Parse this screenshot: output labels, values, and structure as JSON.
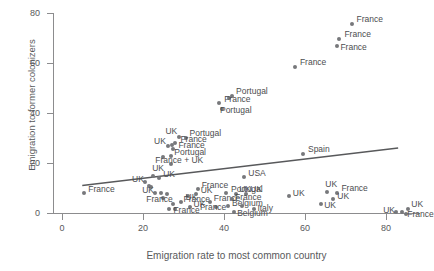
{
  "chart_data": {
    "type": "scatter",
    "title": "",
    "xlabel": "Emigration rate to most common country",
    "ylabel": "Emigration to former colonizers",
    "xlim": [
      0,
      90
    ],
    "ylim": [
      0,
      80
    ],
    "xticks": [
      0,
      20,
      40,
      60,
      80
    ],
    "yticks": [
      0,
      20,
      40,
      60,
      80
    ],
    "grid": false,
    "legend": "none",
    "point_color": "#77787b",
    "trendline": {
      "visible": true,
      "color": "#58595b",
      "x_start": 5,
      "y_start": 11,
      "x_end": 83,
      "y_end": 26
    },
    "labels": [
      "France",
      "UK",
      "Portugal",
      "Spain",
      "USA",
      "Belgium",
      "Italy",
      "France + UK"
    ],
    "points": [
      {
        "x": 71.5,
        "y": 75.5,
        "label": "France",
        "lx": 5,
        "ly": -5
      },
      {
        "x": 68.5,
        "y": 69.5,
        "label": "France",
        "lx": 5,
        "ly": -5
      },
      {
        "x": 68.0,
        "y": 67.0,
        "label": "France",
        "lx": 3,
        "ly": 1
      },
      {
        "x": 57.5,
        "y": 58.5,
        "label": "France",
        "lx": 5,
        "ly": -5
      },
      {
        "x": 42.0,
        "y": 47.0,
        "label": "Portugal",
        "lx": 4,
        "ly": -5
      },
      {
        "x": 41.2,
        "y": 46.0,
        "label": "",
        "lx": 0,
        "ly": 0
      },
      {
        "x": 38.8,
        "y": 44.0,
        "label": "France",
        "lx": 5,
        "ly": -4
      },
      {
        "x": 39.5,
        "y": 41.5,
        "label": "Portugal",
        "lx": -2,
        "ly": 1
      },
      {
        "x": 30.5,
        "y": 30.0,
        "label": "Portugal",
        "lx": 4,
        "ly": -5
      },
      {
        "x": 29.0,
        "y": 30.5,
        "label": "UK",
        "lx": -14,
        "ly": -6
      },
      {
        "x": 28.0,
        "y": 28.0,
        "label": "France",
        "lx": 5,
        "ly": -4
      },
      {
        "x": 27.2,
        "y": 27.2,
        "label": "",
        "lx": 0,
        "ly": 0
      },
      {
        "x": 26.2,
        "y": 26.8,
        "label": "UK",
        "lx": -14,
        "ly": -5
      },
      {
        "x": 27.5,
        "y": 25.5,
        "label": "France",
        "lx": 5,
        "ly": -4
      },
      {
        "x": 27.0,
        "y": 23.0,
        "label": "Portugal",
        "lx": 3,
        "ly": -4
      },
      {
        "x": 25.0,
        "y": 22.5,
        "label": "",
        "lx": 0,
        "ly": 0
      },
      {
        "x": 27.0,
        "y": 19.5,
        "label": "France + UK",
        "lx": -16,
        "ly": -4
      },
      {
        "x": 22.5,
        "y": 15.0,
        "label": "UK",
        "lx": -1,
        "ly": -8
      },
      {
        "x": 24.0,
        "y": 14.0,
        "label": "UK",
        "lx": 4,
        "ly": -4
      },
      {
        "x": 20.5,
        "y": 12.5,
        "label": "UK",
        "lx": -13,
        "ly": -3
      },
      {
        "x": 21.5,
        "y": 11.0,
        "label": "",
        "lx": 0,
        "ly": 0
      },
      {
        "x": 22.0,
        "y": 10.5,
        "label": "",
        "lx": 0,
        "ly": 0
      },
      {
        "x": 59.5,
        "y": 23.5,
        "label": "Spain",
        "lx": 5,
        "ly": -5
      },
      {
        "x": 45.0,
        "y": 14.5,
        "label": "USA",
        "lx": 4,
        "ly": -4
      },
      {
        "x": 33.5,
        "y": 9.5,
        "label": "France",
        "lx": 4,
        "ly": -4
      },
      {
        "x": 23.0,
        "y": 8.0,
        "label": "UK",
        "lx": -13,
        "ly": -3
      },
      {
        "x": 24.5,
        "y": 8.0,
        "label": "",
        "lx": 0,
        "ly": 0
      },
      {
        "x": 26.0,
        "y": 7.8,
        "label": "",
        "lx": 0,
        "ly": 0
      },
      {
        "x": 25.0,
        "y": 6.2,
        "label": "France",
        "lx": -17,
        "ly": 1
      },
      {
        "x": 31.0,
        "y": 7.0,
        "label": "UK",
        "lx": -2,
        "ly": 1
      },
      {
        "x": 33.0,
        "y": 7.5,
        "label": "UK",
        "lx": 5,
        "ly": -4
      },
      {
        "x": 29.5,
        "y": 4.5,
        "label": "France",
        "lx": 2,
        "ly": -3
      },
      {
        "x": 27.5,
        "y": 3.5,
        "label": "",
        "lx": 0,
        "ly": 0
      },
      {
        "x": 31.5,
        "y": 2.5,
        "label": "UK",
        "lx": 4,
        "ly": -3
      },
      {
        "x": 28.0,
        "y": 1.5,
        "label": "France",
        "lx": -2,
        "ly": 1
      },
      {
        "x": 26.5,
        "y": 1.5,
        "label": "",
        "lx": 0,
        "ly": 0
      },
      {
        "x": 36.5,
        "y": 4.5,
        "label": "France",
        "lx": 4,
        "ly": -4
      },
      {
        "x": 40.5,
        "y": 8.0,
        "label": "Portugal",
        "lx": 5,
        "ly": -4
      },
      {
        "x": 43.0,
        "y": 7.5,
        "label": "UK",
        "lx": 3,
        "ly": -5
      },
      {
        "x": 45.5,
        "y": 7.5,
        "label": "UK",
        "lx": 4,
        "ly": -5
      },
      {
        "x": 42.0,
        "y": 5.5,
        "label": "France",
        "lx": 3,
        "ly": -2
      },
      {
        "x": 41.0,
        "y": 3.0,
        "label": "Belgium",
        "lx": 4,
        "ly": -3
      },
      {
        "x": 44.5,
        "y": 3.0,
        "label": "",
        "lx": 0,
        "ly": 0
      },
      {
        "x": 38.0,
        "y": 2.5,
        "label": "France",
        "lx": -16,
        "ly": 0
      },
      {
        "x": 42.5,
        "y": 0.5,
        "label": "Belgium",
        "lx": 3,
        "ly": 1
      },
      {
        "x": 47.5,
        "y": 1.5,
        "label": "Italy",
        "lx": 3,
        "ly": -1
      },
      {
        "x": 56.0,
        "y": 7.0,
        "label": "UK",
        "lx": 4,
        "ly": -3
      },
      {
        "x": 65.5,
        "y": 8.5,
        "label": "UK",
        "lx": -2,
        "ly": -8
      },
      {
        "x": 68.0,
        "y": 8.0,
        "label": "France",
        "lx": 4,
        "ly": -5
      },
      {
        "x": 67.0,
        "y": 5.5,
        "label": "UK",
        "lx": 4,
        "ly": -3
      },
      {
        "x": 64.0,
        "y": 3.5,
        "label": "UK",
        "lx": 3,
        "ly": 1
      },
      {
        "x": 82.5,
        "y": 0.5,
        "label": "UK",
        "lx": -13,
        "ly": -2
      },
      {
        "x": 84.0,
        "y": 0.5,
        "label": "",
        "lx": 0,
        "ly": 0
      },
      {
        "x": 85.5,
        "y": 1.5,
        "label": "UK",
        "lx": 3,
        "ly": -5
      },
      {
        "x": 85.0,
        "y": -0.5,
        "label": "France",
        "lx": 1,
        "ly": 0
      },
      {
        "x": 5.5,
        "y": 8.0,
        "label": "France",
        "lx": 4,
        "ly": -4
      }
    ]
  },
  "axis": {
    "y_title": "Emigration to former colonizers",
    "x_title": "Emigration rate to most common country",
    "y_tick_labels": [
      "0",
      "20",
      "40",
      "60",
      "80"
    ],
    "x_tick_labels": [
      "0",
      "20",
      "40",
      "60",
      "80"
    ]
  }
}
